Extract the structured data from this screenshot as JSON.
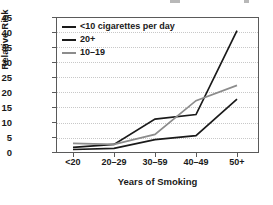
{
  "chart_data": {
    "type": "line",
    "title": "",
    "xlabel": "Years of Smoking",
    "ylabel": "Relative Risk",
    "categories": [
      "<20",
      "20–29",
      "30–59",
      "40–49",
      "50+"
    ],
    "ylim": [
      0,
      45
    ],
    "yticks": [
      0,
      5,
      10,
      15,
      20,
      25,
      30,
      35,
      40,
      45
    ],
    "grid": "horizontal-dotted",
    "legend_position": "top-left-inside",
    "series": [
      {
        "name": "<10 cigarettes per day",
        "color": "#1a1a1a",
        "values": [
          1.0,
          1.4,
          4.3,
          5.6,
          17.7
        ]
      },
      {
        "name": "20+",
        "color": "#1a1a1a",
        "values": [
          1.7,
          2.7,
          11.1,
          12.6,
          40.5
        ]
      },
      {
        "name": "10–19",
        "color": "#8c8c8c",
        "values": [
          3.0,
          2.7,
          6.0,
          17.2,
          22.3
        ]
      }
    ]
  },
  "axes": {
    "y_label": "Relative Risk",
    "x_label": "Years of Smoking",
    "y_ticks": [
      "0",
      "5",
      "10",
      "15",
      "20",
      "25",
      "30",
      "35",
      "40",
      "45"
    ],
    "x_ticks": [
      "<20",
      "20–29",
      "30–59",
      "40–49",
      "50+"
    ]
  },
  "legend": {
    "items": [
      {
        "label": "<10 cigarettes per day",
        "color": "#1a1a1a"
      },
      {
        "label": "20+",
        "color": "#1a1a1a"
      },
      {
        "label": "10–19",
        "color": "#8c8c8c"
      }
    ]
  }
}
